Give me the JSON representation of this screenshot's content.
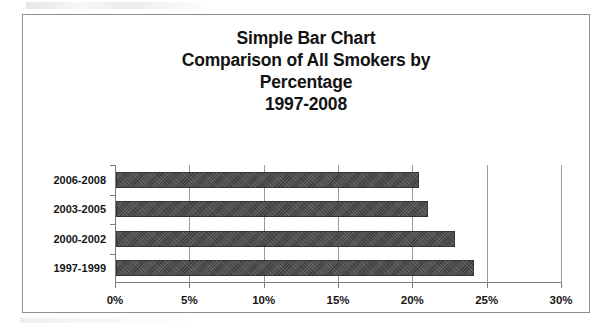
{
  "chart_data": {
    "type": "bar",
    "orientation": "horizontal",
    "title": "Simple Bar Chart Comparison of All Smokers by Percentage 1997-2008",
    "title_lines": [
      "Simple Bar Chart",
      "Comparison of All Smokers by",
      "Percentage",
      "1997-2008"
    ],
    "categories": [
      "2006-2008",
      "2003-2005",
      "2000-2002",
      "1997-1999"
    ],
    "values": [
      20.4,
      21.0,
      22.8,
      24.1
    ],
    "xlabel": "",
    "ylabel": "",
    "xlim": [
      0,
      30
    ],
    "xticks": [
      0,
      5,
      10,
      15,
      20,
      25,
      30
    ],
    "xtick_labels": [
      "0%",
      "5%",
      "10%",
      "15%",
      "20%",
      "25%",
      "30%"
    ],
    "grid": true,
    "grid_axis": "x",
    "legend": false,
    "series": [
      {
        "name": "All Smokers",
        "values": [
          20.4,
          21.0,
          22.8,
          24.1
        ],
        "color": "#4a4a4a"
      }
    ]
  },
  "colors": {
    "bar": "#4a4a4a",
    "gridline": "#9a9a9a",
    "axis": "#7b7b7b",
    "frame": "#8d8d8d",
    "text": "#161616",
    "background": "#ffffff"
  }
}
